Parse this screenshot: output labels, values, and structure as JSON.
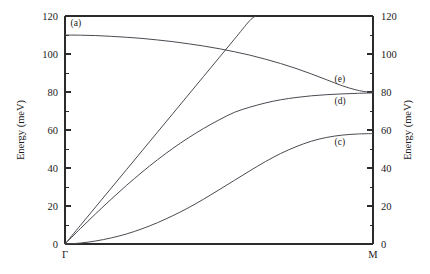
{
  "chart_data": {
    "type": "line",
    "title": "",
    "subtitle": "",
    "xlabel": "",
    "ylabel": "Energy (meV)",
    "ylabel_right": "Energy (meV)",
    "xlim": [
      0,
      1
    ],
    "ylim": [
      0,
      120
    ],
    "grid": false,
    "legend": "none",
    "x_tick_labels": [
      "Γ",
      "M"
    ],
    "x_tick_positions": [
      0,
      1
    ],
    "y_ticks": [
      0,
      20,
      40,
      60,
      80,
      100,
      120
    ],
    "y_tick_labels": [
      "0",
      "20",
      "40",
      "60",
      "80",
      "100",
      "120"
    ],
    "y_minor_ticks": [
      10,
      30,
      50,
      70,
      90,
      110
    ],
    "annotations": [
      {
        "text": "(a)",
        "x": 0.018,
        "y": 114.5
      },
      {
        "text": "(e)",
        "x": 0.875,
        "y": 85.5
      },
      {
        "text": "(d)",
        "x": 0.875,
        "y": 73.5
      },
      {
        "text": "(c)",
        "x": 0.875,
        "y": 52.0
      }
    ],
    "series": [
      {
        "name": "(a) optical branch",
        "label": "(a)",
        "x": [
          0,
          0.05,
          0.1,
          0.15,
          0.2,
          0.25,
          0.3,
          0.35,
          0.4,
          0.45,
          0.5,
          0.55,
          0.6,
          0.65,
          0.7,
          0.75,
          0.8,
          0.85,
          0.9,
          0.95,
          1.0
        ],
        "values": [
          110.0,
          109.9,
          109.7,
          109.3,
          108.8,
          108.2,
          107.4,
          106.5,
          105.4,
          104.2,
          102.8,
          101.2,
          99.4,
          97.3,
          95.0,
          92.4,
          89.5,
          86.4,
          83.3,
          80.9,
          79.6
        ]
      },
      {
        "name": "steep acoustic branch (LA)",
        "label": "",
        "x": [
          0,
          0.05,
          0.1,
          0.15,
          0.2,
          0.25,
          0.3,
          0.35,
          0.4,
          0.45,
          0.5,
          0.55,
          0.6,
          0.62
        ],
        "values": [
          0,
          9.8,
          19.6,
          29.4,
          39.2,
          49.0,
          58.8,
          68.6,
          78.4,
          88.2,
          98.0,
          107.8,
          117.6,
          120.0
        ]
      },
      {
        "name": "(d) intermediate acoustic branch (TA)",
        "label": "(d)",
        "x": [
          0,
          0.05,
          0.1,
          0.15,
          0.2,
          0.25,
          0.3,
          0.35,
          0.4,
          0.45,
          0.5,
          0.55,
          0.6,
          0.65,
          0.7,
          0.75,
          0.8,
          0.85,
          0.9,
          0.95,
          1.0
        ],
        "values": [
          0,
          8.1,
          16.0,
          23.6,
          30.9,
          37.8,
          44.3,
          50.3,
          55.8,
          60.8,
          65.3,
          69.3,
          72.0,
          74.2,
          75.9,
          77.1,
          78.0,
          78.6,
          79.0,
          79.3,
          79.5
        ]
      },
      {
        "name": "(c) flexural acoustic branch (ZA)",
        "label": "(c)",
        "x": [
          0,
          0.05,
          0.1,
          0.15,
          0.2,
          0.25,
          0.3,
          0.35,
          0.4,
          0.45,
          0.5,
          0.55,
          0.6,
          0.65,
          0.7,
          0.75,
          0.8,
          0.85,
          0.9,
          0.95,
          1.0
        ],
        "values": [
          0,
          0.5,
          1.6,
          3.2,
          5.3,
          8.0,
          11.2,
          14.9,
          19.0,
          23.6,
          28.5,
          33.5,
          38.5,
          43.3,
          47.6,
          51.2,
          54.1,
          56.1,
          57.3,
          57.9,
          58.1
        ]
      }
    ]
  },
  "axes": {
    "y_left_title": "Energy (meV)",
    "y_right_title": "Energy (meV)"
  },
  "colors": {
    "axis": "#2b2b2b",
    "curve": "#4a4a52",
    "background": "#ffffff"
  }
}
